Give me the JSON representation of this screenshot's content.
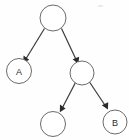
{
  "diagram": {
    "type": "tree",
    "canvas": {
      "width": 129,
      "height": 140,
      "background": "#fefefe"
    },
    "style": {
      "node_fill": "#ffffff",
      "node_stroke": "#6b6b6b",
      "edge_color": "#3a3a3a",
      "label_color": "#2a2a2a"
    },
    "nodes": [
      {
        "id": "root",
        "label": "",
        "cx": 53,
        "cy": 18,
        "r": 13
      },
      {
        "id": "left-a",
        "label": "A",
        "cx": 19,
        "cy": 71,
        "r": 12.5
      },
      {
        "id": "right-inner",
        "label": "",
        "cx": 82,
        "cy": 73,
        "r": 12
      },
      {
        "id": "bottom-left",
        "label": "",
        "cx": 53,
        "cy": 124,
        "r": 12.5
      },
      {
        "id": "bottom-right",
        "label": "B",
        "cx": 115,
        "cy": 122,
        "r": 12
      }
    ],
    "edges": [
      {
        "id": "root-to-left-a",
        "from": "root",
        "to": "left-a",
        "directed": true
      },
      {
        "id": "root-to-right-inner",
        "from": "root",
        "to": "right-inner",
        "directed": true
      },
      {
        "id": "right-inner-to-bottom-left",
        "from": "right-inner",
        "to": "bottom-left",
        "directed": true
      },
      {
        "id": "right-inner-to-bottom-right",
        "from": "right-inner",
        "to": "bottom-right",
        "directed": true
      }
    ],
    "labels": {
      "node_a": "A",
      "node_b": "B",
      "node_root": "",
      "node_right_inner": "",
      "node_bottom_left": ""
    }
  }
}
